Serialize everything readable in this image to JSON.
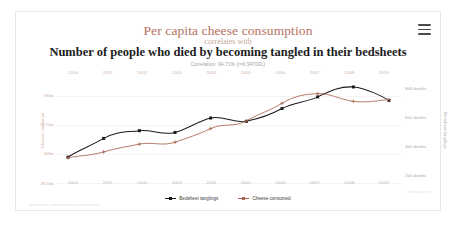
{
  "card": {
    "menu_icon": "hamburger-menu-icon",
    "title_top": "Per capita cheese consumption",
    "title_middle": "correlates with",
    "title_bottom": "Number of people who died by becoming tangled in their bedsheets",
    "correlation_text": "Correlation: 94.71% (r=0.947091)",
    "footer_left": "tylervigen.com/spurious-correlations",
    "footer_right": "tylervigen.com"
  },
  "colors": {
    "accent_salmon": "#b5705e",
    "series_black": "#1a1a1a",
    "series_red": "#a8654f",
    "left_axis_text": "#d2b0a4",
    "right_axis_text": "#a9a9a9",
    "grid": "#f4f4f4",
    "card_border": "#e6e6e6"
  },
  "legend": [
    {
      "label": "Bedsheet tanglings",
      "color": "#1a1a1a"
    },
    {
      "label": "Cheese consumed",
      "color": "#a8654f"
    }
  ],
  "chart_data": {
    "type": "line",
    "title": "Per capita cheese consumption correlates with Number of people who died by becoming tangled in their bedsheets",
    "subtitle": "Correlation: 94.71% (r=0.947091)",
    "xlabel": "",
    "grid": true,
    "legend_position": "bottom",
    "x": [
      2000,
      2001,
      2002,
      2003,
      2004,
      2005,
      2006,
      2007,
      2008,
      2009
    ],
    "x_tick_labels": [
      "2000",
      "2001",
      "2002",
      "2003",
      "2004",
      "2005",
      "2006",
      "2007",
      "2008",
      "2009"
    ],
    "x_axis_top": true,
    "x_axis_bottom": true,
    "axes": [
      {
        "id": "left",
        "label": "Cheese consumed",
        "tick_labels": [
          "33lbs",
          "31.5lbs",
          "30lbs",
          "28.5lbs"
        ],
        "tick_values": [
          33,
          31.5,
          30,
          28.5
        ],
        "ylim": [
          28.5,
          33.75
        ]
      },
      {
        "id": "right",
        "label": "Bedsheet tanglings",
        "tick_labels": [
          "800 deaths",
          "600 deaths",
          "400 deaths",
          "200 deaths"
        ],
        "tick_values": [
          800,
          600,
          400,
          200
        ],
        "ylim": [
          150,
          850
        ]
      }
    ],
    "series": [
      {
        "name": "Bedsheet tanglings",
        "axis": "right",
        "color": "#1a1a1a",
        "marker": "square",
        "values": [
          327,
          456,
          509,
          497,
          596,
          573,
          661,
          741,
          809,
          717
        ],
        "units": "deaths"
      },
      {
        "name": "Cheese consumed",
        "axis": "left",
        "color": "#a8654f",
        "marker": "plus",
        "values": [
          29.8,
          30.1,
          30.5,
          30.6,
          31.3,
          31.7,
          32.6,
          33.1,
          32.7,
          32.8
        ],
        "units": "lbs"
      }
    ]
  }
}
